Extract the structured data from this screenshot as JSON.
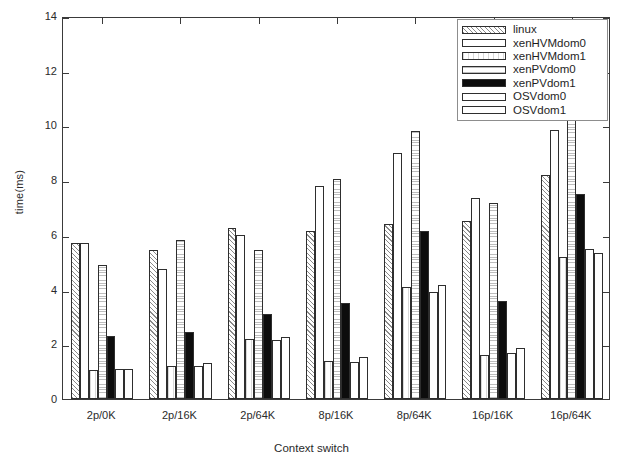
{
  "chart_data": {
    "type": "bar",
    "title": "",
    "xlabel": "Context switch",
    "ylabel": "time(ms)",
    "ylim": [
      0,
      14
    ],
    "yticks": [
      0,
      2,
      4,
      6,
      8,
      10,
      12,
      14
    ],
    "ytick_labels": [
      "0",
      "2",
      "4",
      "6",
      "8",
      "10",
      "12",
      "14"
    ],
    "grid": false,
    "legend_position": "top-right",
    "categories": [
      "2p/0K",
      "2p/16K",
      "2p/64K",
      "8p/16K",
      "8p/64K",
      "16p/16K",
      "16p/64K"
    ],
    "series": [
      {
        "name": "linux",
        "pattern": "diagonal-hatch",
        "values": [
          5.7,
          5.45,
          6.25,
          6.15,
          6.4,
          6.5,
          8.2
        ]
      },
      {
        "name": "xenHVMdom0",
        "pattern": "solid-white",
        "values": [
          5.7,
          4.75,
          6.0,
          7.8,
          9.0,
          7.35,
          9.85
        ]
      },
      {
        "name": "xenHVMdom1",
        "pattern": "vertical-light",
        "values": [
          1.05,
          1.2,
          2.2,
          1.4,
          4.1,
          1.6,
          5.2
        ]
      },
      {
        "name": "xenPVdom0",
        "pattern": "stipple",
        "values": [
          4.9,
          5.8,
          5.45,
          8.05,
          9.8,
          7.15,
          10.4
        ]
      },
      {
        "name": "xenPVdom1",
        "pattern": "solid-black",
        "values": [
          2.3,
          2.45,
          3.1,
          3.5,
          6.15,
          3.6,
          7.5
        ]
      },
      {
        "name": "OSVdom0",
        "pattern": "solid-white",
        "values": [
          1.1,
          1.2,
          2.15,
          1.35,
          3.9,
          1.7,
          5.5
        ]
      },
      {
        "name": "OSVdom1",
        "pattern": "solid-white",
        "values": [
          1.1,
          1.3,
          2.25,
          1.55,
          4.15,
          1.85,
          5.35
        ]
      }
    ]
  },
  "legend": {
    "items": [
      {
        "label": "linux"
      },
      {
        "label": "xenHVMdom0"
      },
      {
        "label": "xenHVMdom1"
      },
      {
        "label": "xenPVdom0"
      },
      {
        "label": "xenPVdom1"
      },
      {
        "label": "OSVdom0"
      },
      {
        "label": "OSVdom1"
      }
    ]
  },
  "colors": {
    "axis": "#3a3a3a",
    "text": "#2a2a2a",
    "bar_outline": "#2e2e2e",
    "bar_black": "#0d0d0d",
    "background": "#ffffff"
  }
}
